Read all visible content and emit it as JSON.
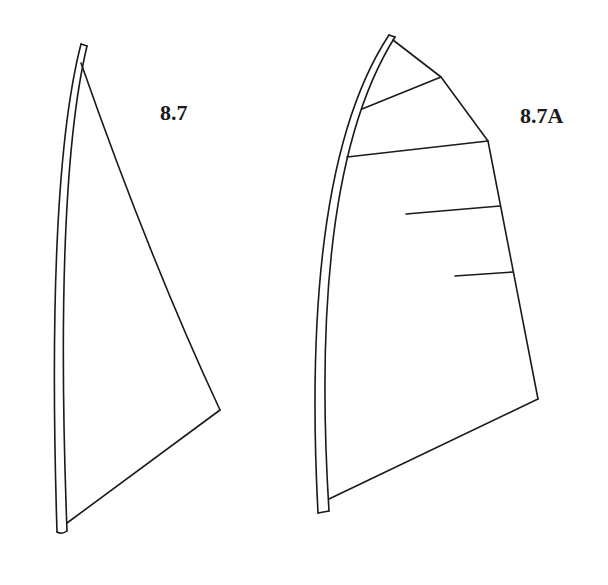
{
  "figures": [
    {
      "id": "sail-8-7",
      "label": "8.7",
      "description": "Triangular sail on a curved mast, no battens",
      "mast": {
        "top": [
          84,
          44
        ],
        "bottom": [
          63,
          532
        ]
      },
      "sail": {
        "head": [
          81,
          63
        ],
        "clew": [
          220,
          410
        ],
        "tack": [
          67,
          523
        ]
      }
    },
    {
      "id": "sail-8-7a",
      "label": "8.7A",
      "description": "Fully battened sail with roach on a curved mast",
      "mast": {
        "top": [
          392,
          36
        ],
        "bottom": [
          324,
          513
        ]
      },
      "sail": {
        "head": [
          393,
          40
        ],
        "leech_points": [
          [
            441,
            77
          ],
          [
            488,
            141
          ],
          [
            538,
            399
          ]
        ],
        "tack": [
          329,
          499
        ]
      },
      "battens": [
        {
          "from": [
            362,
            109
          ],
          "to": [
            441,
            77
          ]
        },
        {
          "from": [
            347,
            157
          ],
          "to": [
            488,
            141
          ]
        },
        {
          "from": [
            406,
            214
          ],
          "to": [
            500,
            206
          ]
        },
        {
          "from": [
            455,
            276
          ],
          "to": [
            513,
            272
          ]
        }
      ]
    }
  ],
  "colors": {
    "line": "#1a1a1a",
    "background": "#ffffff"
  }
}
